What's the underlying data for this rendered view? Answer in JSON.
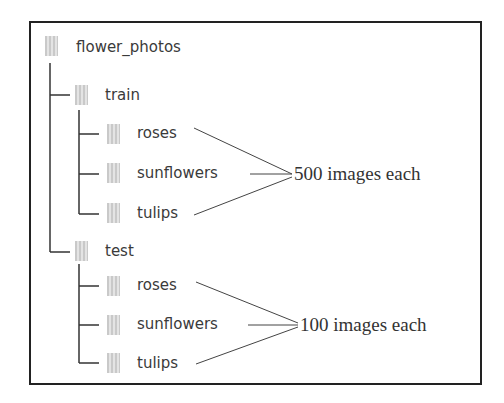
{
  "tree": {
    "root": {
      "label": "flower_photos",
      "icon": "folder-icon"
    },
    "train": {
      "label": "train",
      "icon": "folder-icon",
      "children": [
        "roses",
        "sunflowers",
        "tulips"
      ],
      "annotation": "500 images each"
    },
    "test": {
      "label": "test",
      "icon": "folder-icon",
      "children": [
        "roses",
        "sunflowers",
        "tulips"
      ],
      "annotation": "100 images each"
    }
  }
}
